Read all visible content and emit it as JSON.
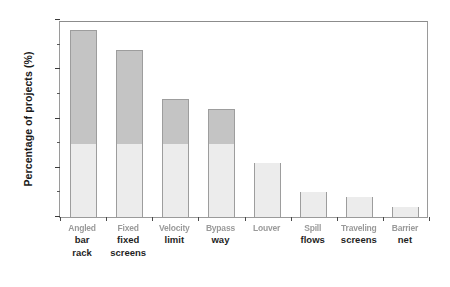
{
  "chart_data": {
    "type": "bar",
    "title": "",
    "subtitle": "",
    "xlabel": "",
    "ylabel": "Percentage of projects (%)",
    "ylim": [
      0,
      40
    ],
    "ytick_labels": [
      "0",
      "10",
      "20",
      "30",
      "40"
    ],
    "ytick_values": [
      0,
      10,
      20,
      30,
      40
    ],
    "yminor_values": [
      5,
      15,
      25,
      35
    ],
    "grid": false,
    "legend": null,
    "legend_position": "none",
    "stacked": true,
    "stack_split_value": 15,
    "categories": [
      "bar rack",
      "fixed screens",
      "limit",
      "way",
      "",
      "flows",
      "screens",
      "net"
    ],
    "category_lines": [
      {
        "smudged": "Angled",
        "line1": "bar",
        "line2": "rack"
      },
      {
        "smudged": "Fixed",
        "line1": "fixed",
        "line2": "screens"
      },
      {
        "smudged": "Velocity",
        "line1": "limit",
        "line2": ""
      },
      {
        "smudged": "Bypass",
        "line1": "way",
        "line2": ""
      },
      {
        "smudged": "Louver",
        "line1": "",
        "line2": ""
      },
      {
        "smudged": "Spill",
        "line1": "flows",
        "line2": ""
      },
      {
        "smudged": "Traveling",
        "line1": "screens",
        "line2": ""
      },
      {
        "smudged": "Barrier",
        "line1": "net",
        "line2": ""
      }
    ],
    "values": [
      38,
      34,
      24,
      22,
      11,
      5,
      4,
      2
    ],
    "series": [
      {
        "name": "lower segment",
        "values": [
          15,
          15,
          15,
          15,
          11,
          5,
          4,
          2
        ],
        "color": "#ececec"
      },
      {
        "name": "upper segment",
        "values": [
          23,
          19,
          9,
          7,
          0,
          0,
          0,
          0
        ],
        "color": "#c4c4c4"
      }
    ]
  },
  "axes": {
    "frame_color": "#9a9a9a",
    "tick_color": "#3a3a3a",
    "text_color": "#1a1a1a"
  }
}
